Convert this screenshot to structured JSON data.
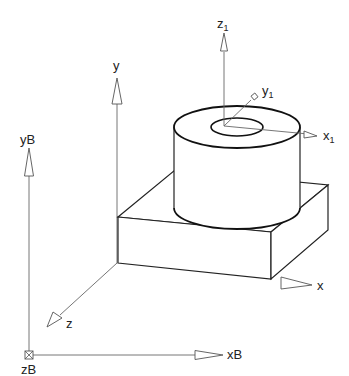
{
  "diagram": {
    "base_frame": {
      "x_label": "xB",
      "y_label": "yB",
      "z_label": "zB"
    },
    "block_frame": {
      "x_label": "x",
      "y_label": "y",
      "z_label": "z"
    },
    "cylinder_frame": {
      "x_label": "x",
      "x_sub": "1",
      "y_label": "y",
      "y_sub": "1",
      "z_label": "z",
      "z_sub": "1"
    },
    "objects": [
      {
        "name": "rectangular block",
        "type": "box"
      },
      {
        "name": "hollow cylinder",
        "type": "tube"
      }
    ],
    "colors": {
      "line": "#222222",
      "axis": "#666666",
      "background": "#ffffff"
    }
  }
}
